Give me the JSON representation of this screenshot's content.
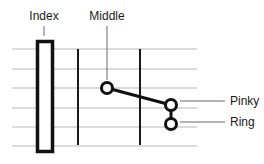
{
  "diagram": {
    "labels": {
      "index": "Index",
      "middle": "Middle",
      "pinky": "Pinky",
      "ring": "Ring"
    },
    "colors": {
      "string": "#b8b8b8",
      "fret": "#1a1a1a",
      "marker": "#111111",
      "leader": "#6a6a6a"
    },
    "strings_y": [
      49,
      69,
      88,
      108,
      127,
      146
    ],
    "frets_x": [
      78,
      140
    ],
    "fingers": [
      {
        "name": "Index",
        "type": "barre",
        "x": 36,
        "y": 40,
        "w": 17,
        "h": 112
      },
      {
        "name": "Middle",
        "type": "dot",
        "cx": 107,
        "cy": 88
      },
      {
        "name": "Pinky",
        "type": "dot",
        "cx": 171,
        "cy": 105
      },
      {
        "name": "Ring",
        "type": "dot",
        "cx": 171,
        "cy": 124
      }
    ]
  }
}
